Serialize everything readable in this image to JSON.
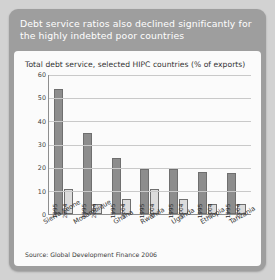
{
  "figure": {
    "header_lines": [
      "Debt service ratios also declined significantly for",
      "the highly indebted poor countries"
    ],
    "source": "Source: Global Development Finance 2006",
    "colors": {
      "panel_bg": "#9e9e9e",
      "card_bg": "#fbfbfb",
      "series_1995": "#8d8d8d",
      "series_2004": "#dcdcdc",
      "axis": "#8e8e8e",
      "gridline": "#c9c9c9"
    }
  },
  "chart_data": {
    "type": "bar",
    "title": "Total debt service, selected HIPC countries (% of exports)",
    "xlabel": "",
    "ylabel": "",
    "ylim": [
      0,
      60
    ],
    "yticks": [
      0,
      10,
      20,
      30,
      40,
      50,
      60
    ],
    "grid": true,
    "legend": "none",
    "categories": [
      "Sierra Leone",
      "Mozambique",
      "Ghana",
      "Rwanda",
      "Uganda",
      "Ethiopia",
      "Tanzania"
    ],
    "series": [
      {
        "name": "1995",
        "values": [
          54,
          35,
          24,
          19.5,
          19.5,
          18,
          17.5
        ]
      },
      {
        "name": "2004",
        "values": [
          11,
          4.5,
          6.5,
          10.8,
          6.5,
          4.5,
          4.5
        ]
      }
    ]
  }
}
